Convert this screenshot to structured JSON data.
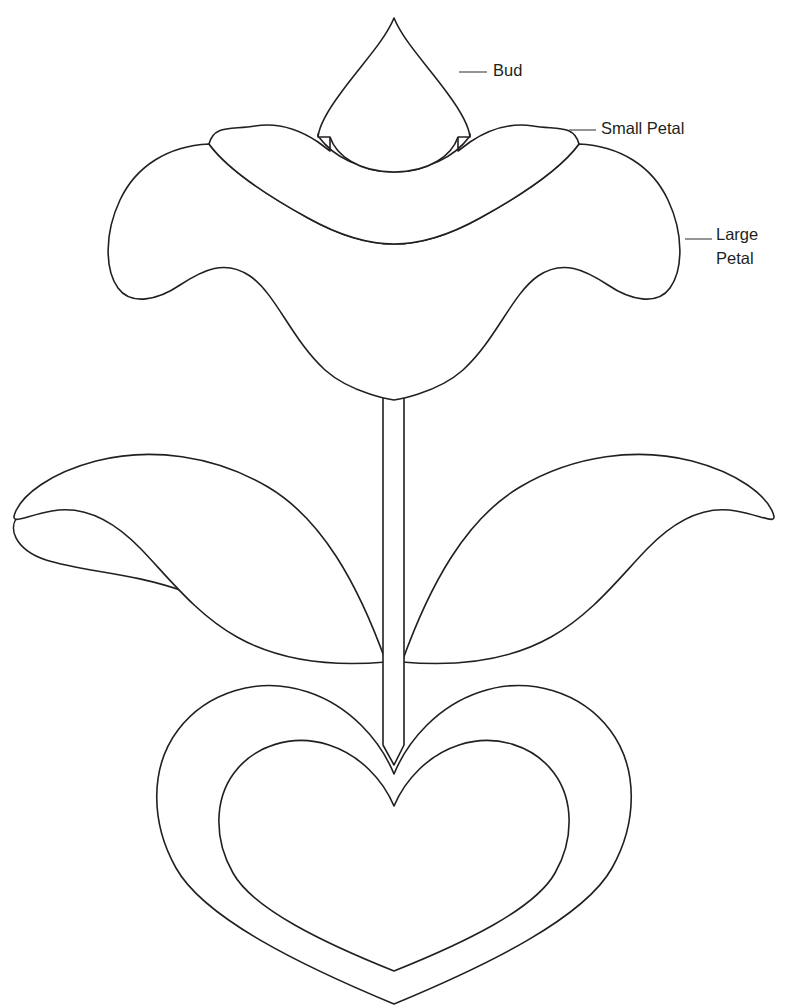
{
  "document": {
    "title": "Flower Applique Template",
    "background_color": "#ffffff",
    "stroke_color": "#231f20",
    "leader_color": "#5b5b5b",
    "width": 787,
    "height": 1008
  },
  "labels": {
    "bud": "Bud",
    "small_petal": "Small Petal",
    "large_petal_line1": "Large",
    "large_petal_line2": "Petal"
  },
  "parts": {
    "bud": "bud",
    "small_petal_layer": "small-petal-layer",
    "large_petal_layer": "large-petal-layer",
    "stem": "stem",
    "leaf_left": "leaf-left",
    "leaf_right": "leaf-right",
    "heart_outer": "heart-outer",
    "heart_inner": "heart-inner"
  }
}
